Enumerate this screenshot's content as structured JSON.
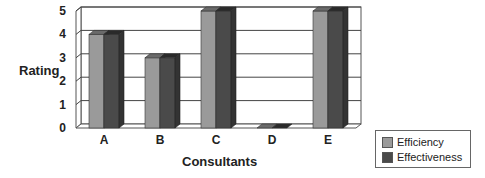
{
  "chart_data": {
    "type": "bar",
    "title": "",
    "xlabel": "Consultants",
    "ylabel": "Rating",
    "categories": [
      "A",
      "B",
      "C",
      "D",
      "E"
    ],
    "series": [
      {
        "name": "Efficiency",
        "values": [
          4,
          3,
          5,
          0,
          5
        ],
        "color": "#9a9a9a"
      },
      {
        "name": "Effectiveness",
        "values": [
          4,
          3,
          5,
          0,
          5
        ],
        "color": "#4a4a4a"
      }
    ],
    "yticks": [
      "0",
      "1",
      "2",
      "3",
      "4",
      "5"
    ],
    "ylim": [
      0,
      5
    ],
    "grid": true,
    "legend_position": "bottom-right",
    "style": "3d-clustered-column"
  },
  "labels": {
    "ylabel": "Rating",
    "xlabel": "Consultants",
    "legend": [
      "Efficiency",
      "Effectiveness"
    ]
  }
}
